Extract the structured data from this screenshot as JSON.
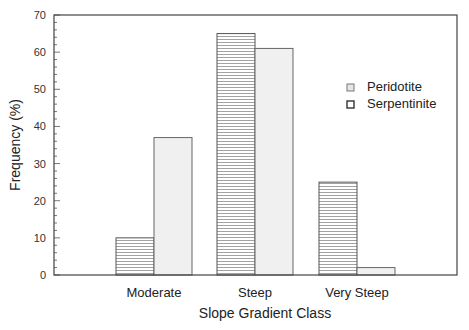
{
  "chart_data": {
    "type": "bar",
    "title": "",
    "xlabel": "Slope Gradient Class",
    "ylabel": "Frequency (%)",
    "categories": [
      "Moderate",
      "Steep",
      "Very Steep"
    ],
    "series": [
      {
        "name": "Peridotite",
        "values": [
          37,
          61,
          2
        ],
        "fill": "#f0f0f0",
        "pattern": "solid-light"
      },
      {
        "name": "Serpentinite",
        "values": [
          10,
          65,
          25
        ],
        "fill": "#ffffff",
        "pattern": "horizontal-hatch"
      }
    ],
    "ylim": [
      0,
      70
    ],
    "yticks": [
      0,
      10,
      20,
      30,
      40,
      50,
      60,
      70
    ],
    "grid": false,
    "legend_position": "upper-right-inside"
  },
  "legend": {
    "items": [
      {
        "label": "Peridotite"
      },
      {
        "label": "Serpentinite"
      }
    ]
  }
}
